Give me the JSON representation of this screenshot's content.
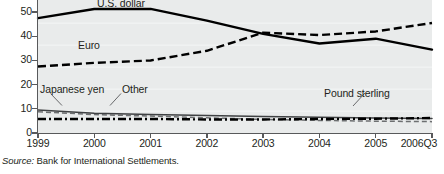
{
  "chart_data": {
    "type": "line",
    "title": "",
    "subtitle": "",
    "xlabel": "",
    "ylabel": "",
    "ylim": [
      0,
      55
    ],
    "yticks": [
      0,
      10,
      20,
      30,
      40,
      50
    ],
    "ytick_labels": [
      "0",
      "10",
      "20",
      "30",
      "40",
      "50"
    ],
    "grid": false,
    "legend_position": "inline-annotations",
    "x": [
      "1999",
      "2000",
      "2001",
      "2002",
      "2003",
      "2004",
      "2005",
      "2006Q3"
    ],
    "xtick_labels": [
      "1999",
      "2000",
      "2001",
      "2002",
      "2003",
      "2004",
      "2005",
      "2006Q3"
    ],
    "series": [
      {
        "name": "U.S. dollar",
        "style": "solid-thick",
        "values": [
          47.5,
          51.3,
          51.3,
          46.5,
          41.0,
          37.0,
          39.0,
          34.5
        ]
      },
      {
        "name": "Euro",
        "style": "dashed",
        "values": [
          27.5,
          29.0,
          30.0,
          34.0,
          41.5,
          40.5,
          42.0,
          45.5
        ]
      },
      {
        "name": "Japanese yen",
        "style": "thin-solid",
        "values": [
          9.5,
          8.2,
          7.6,
          7.2,
          6.8,
          6.5,
          6.2,
          6.0
        ]
      },
      {
        "name": "Other",
        "style": "thin-dashed",
        "values": [
          8.8,
          7.6,
          7.0,
          6.3,
          5.6,
          5.2,
          4.9,
          4.7
        ]
      },
      {
        "name": "Pound sterling",
        "style": "dash-dot",
        "values": [
          5.8,
          5.8,
          5.8,
          5.6,
          5.6,
          5.8,
          5.9,
          6.2
        ]
      }
    ],
    "annotations": [
      {
        "text": "U.S. dollar",
        "name": "us-dollar"
      },
      {
        "text": "Euro",
        "name": "euro"
      },
      {
        "text": "Japanese yen",
        "name": "japanese-yen"
      },
      {
        "text": "Other",
        "name": "other"
      },
      {
        "text": "Pound sterling",
        "name": "pound-sterling"
      }
    ],
    "colors": {
      "plot_background": "#e9ebeb",
      "axis": "#58595b",
      "line": "#000000",
      "text": "#231f20"
    }
  },
  "source": {
    "label": "Source:",
    "text": "Bank for International Settlements."
  }
}
